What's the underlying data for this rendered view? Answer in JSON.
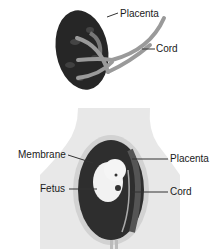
{
  "top_figure": {
    "name": "placenta-with-cord",
    "labels": {
      "placenta": "Placenta",
      "cord": "Cord"
    }
  },
  "bottom_figure": {
    "name": "uterus-cross-section",
    "labels": {
      "membrane": "Membrane",
      "placenta": "Placenta",
      "fetus": "Fetus",
      "cord": "Cord"
    }
  },
  "colors": {
    "placenta_dark": "#2b2b2b",
    "cord_gray": "#9a9a9a",
    "body_light": "#e6e6e6",
    "uterus_wall": "#cfcfcf",
    "fetus": "#f2f2f2"
  }
}
